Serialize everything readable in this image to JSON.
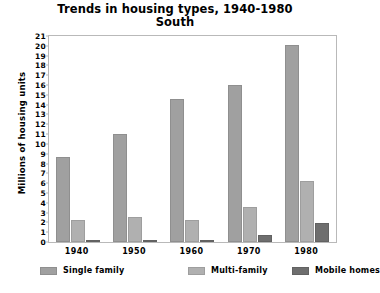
{
  "chart_data": {
    "type": "bar",
    "title": "Trends in housing types, 1940-1980",
    "subtitle": "South",
    "xlabel": "",
    "ylabel": "Millions of housing units",
    "categories": [
      "1940",
      "1950",
      "1960",
      "1970",
      "1980"
    ],
    "series": [
      {
        "name": "Single family",
        "color": "#a0a0a0",
        "values": [
          8.7,
          11.0,
          14.6,
          16.0,
          20.1
        ]
      },
      {
        "name": "Multi-family",
        "color": "#b0b0b0",
        "values": [
          2.2,
          2.5,
          2.2,
          3.6,
          6.2
        ]
      },
      {
        "name": "Mobile homes",
        "color": "#6e6e6e",
        "values": [
          0.0,
          0.05,
          0.15,
          0.7,
          1.9
        ]
      }
    ],
    "ylim": [
      0,
      21
    ],
    "ytick_step": 1,
    "yticks": [
      "0",
      "1",
      "2",
      "3",
      "4",
      "5",
      "6",
      "7",
      "8",
      "9",
      "10",
      "11",
      "12",
      "13",
      "14",
      "15",
      "16",
      "17",
      "18",
      "19",
      "20",
      "21"
    ],
    "grid": false,
    "legend_position": "bottom"
  }
}
